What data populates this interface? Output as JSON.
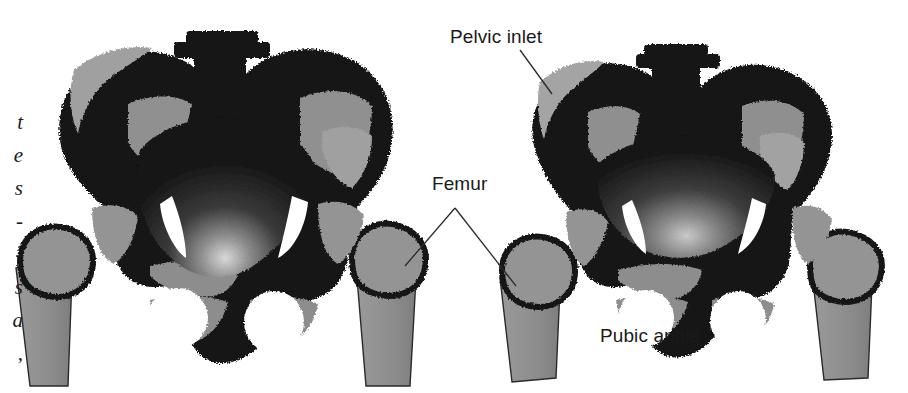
{
  "figure": {
    "kind": "anatomy-comparison-plate",
    "background_color": "#ffffff",
    "bone_dark_color": "#151515",
    "bone_gray_color": "#8f8f8f",
    "bone_gray_light_color": "#a3a3a3",
    "cavity_dark_color": "#1b1b1b",
    "label_color": "#1a1a1a",
    "leader_color": "#2a2a2a"
  },
  "labels": [
    {
      "id": "pelvic-inlet",
      "text": "Pelvic inlet",
      "x": 450,
      "y": 26
    },
    {
      "id": "femur",
      "text": "Femur",
      "x": 432,
      "y": 173
    },
    {
      "id": "pubic-angle",
      "text": "Pubic angle",
      "x": 600,
      "y": 325
    }
  ],
  "panels": [
    {
      "id": "female-pelvis",
      "position": "left",
      "center_x": 216,
      "center_y": 205,
      "inlet_shape": "wide oval",
      "pubic_angle_description": "wide"
    },
    {
      "id": "male-pelvis",
      "position": "right",
      "center_x": 680,
      "center_y": 205,
      "inlet_shape": "narrow heart",
      "pubic_angle_description": "narrow"
    }
  ],
  "margin_text_fragments": [
    {
      "char": "t",
      "y": 112
    },
    {
      "char": "e",
      "y": 145
    },
    {
      "char": "s",
      "y": 178
    },
    {
      "char": "-",
      "y": 211
    },
    {
      "char": "-",
      "y": 244
    },
    {
      "char": "s",
      "y": 277
    },
    {
      "char": "a",
      "y": 310
    },
    {
      "char": ",",
      "y": 343
    }
  ]
}
